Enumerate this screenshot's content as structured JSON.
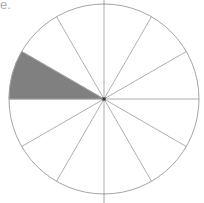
{
  "figure": {
    "name": "fraction-circle-twelfths",
    "type": "pie",
    "corner_text_fragment": "e.",
    "background_color": "#ffffff"
  },
  "chart_data": {
    "type": "pie",
    "title": "",
    "subtitle": "",
    "xlabel": "",
    "ylabel": "",
    "grid": false,
    "legend": "none",
    "total_slices": 12,
    "slice_angle_degrees": 30,
    "shaded_count": 1,
    "unshaded_count": 11,
    "fraction_shaded": "1/12",
    "percent_shaded": 8.33,
    "categories": [
      "sector-1",
      "sector-2",
      "sector-3",
      "sector-4",
      "sector-5",
      "sector-6",
      "sector-7",
      "sector-8",
      "sector-9",
      "sector-10",
      "sector-11",
      "sector-12"
    ],
    "values": [
      30,
      30,
      30,
      30,
      30,
      30,
      30,
      30,
      30,
      30,
      30,
      30
    ],
    "series": [
      {
        "name": "shaded",
        "values": [
          0,
          0,
          0,
          0,
          0,
          0,
          1,
          0,
          0,
          0,
          0,
          0
        ]
      }
    ],
    "shaded_sector_indices": [
      6
    ],
    "shaded_sector_start_degrees": 180,
    "shaded_sector_end_degrees": 210,
    "colors": {
      "shaded_fill": "#808080",
      "unshaded_fill": "#ffffff",
      "outline": "#9a9a9a",
      "spoke": "#9a9a9a",
      "center_dot": "#3a3a3a"
    },
    "geometry": {
      "center_x": 104,
      "center_y": 99,
      "radius": 95,
      "clipped_top": true,
      "clipped_bottom": true
    }
  }
}
